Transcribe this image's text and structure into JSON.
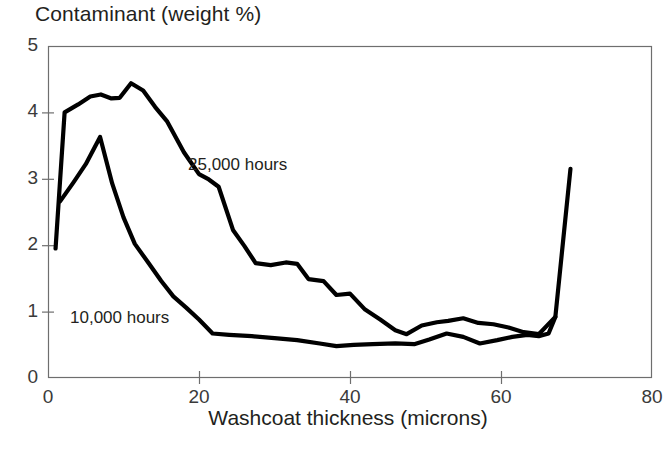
{
  "chart_data": {
    "type": "line",
    "title": "Contaminant (weight %)",
    "xlabel": "Washcoat thickness (microns)",
    "ylabel": "Contaminant (weight %)",
    "xlim": [
      0,
      80
    ],
    "ylim": [
      0,
      5
    ],
    "xticks": [
      "0",
      "20",
      "40",
      "60",
      "80"
    ],
    "yticks": [
      "0",
      "1",
      "2",
      "3",
      "4",
      "5"
    ],
    "grid": false,
    "legend_position": "inline-annotations",
    "line_color": "#000000",
    "axis_color": "#6e6e6e",
    "series": [
      {
        "name": "25,000 hours",
        "label_x": 188,
        "label_y": 155,
        "points": [
          [
            1.0,
            1.95
          ],
          [
            2.2,
            4.0
          ],
          [
            4.0,
            4.12
          ],
          [
            5.6,
            4.24
          ],
          [
            7.0,
            4.27
          ],
          [
            8.4,
            4.21
          ],
          [
            9.5,
            4.22
          ],
          [
            11.0,
            4.44
          ],
          [
            12.6,
            4.33
          ],
          [
            14.2,
            4.08
          ],
          [
            15.8,
            3.86
          ],
          [
            18.0,
            3.4
          ],
          [
            20.0,
            3.07
          ],
          [
            21.3,
            2.99
          ],
          [
            22.6,
            2.88
          ],
          [
            24.5,
            2.23
          ],
          [
            26.0,
            1.99
          ],
          [
            27.5,
            1.73
          ],
          [
            29.5,
            1.7
          ],
          [
            31.5,
            1.74
          ],
          [
            33.0,
            1.72
          ],
          [
            34.5,
            1.49
          ],
          [
            36.5,
            1.46
          ],
          [
            38.2,
            1.25
          ],
          [
            40.0,
            1.27
          ],
          [
            42.0,
            1.03
          ],
          [
            44.0,
            0.88
          ],
          [
            46.0,
            0.72
          ],
          [
            47.5,
            0.66
          ],
          [
            49.5,
            0.79
          ],
          [
            51.5,
            0.84
          ],
          [
            53.0,
            0.86
          ],
          [
            55.0,
            0.9
          ],
          [
            57.0,
            0.83
          ],
          [
            59.0,
            0.81
          ],
          [
            61.0,
            0.76
          ],
          [
            63.0,
            0.69
          ],
          [
            65.0,
            0.66
          ],
          [
            67.2,
            0.92
          ],
          [
            69.2,
            3.15
          ]
        ]
      },
      {
        "name": "10,000 hours",
        "label_x": 70,
        "label_y": 308,
        "points": [
          [
            1.6,
            2.66
          ],
          [
            3.4,
            2.95
          ],
          [
            5.0,
            3.22
          ],
          [
            6.9,
            3.63
          ],
          [
            8.5,
            2.93
          ],
          [
            10.0,
            2.42
          ],
          [
            11.5,
            2.02
          ],
          [
            13.2,
            1.75
          ],
          [
            15.0,
            1.46
          ],
          [
            16.6,
            1.23
          ],
          [
            18.3,
            1.06
          ],
          [
            20.0,
            0.88
          ],
          [
            21.8,
            0.67
          ],
          [
            24.0,
            0.65
          ],
          [
            27.0,
            0.63
          ],
          [
            30.0,
            0.6
          ],
          [
            33.0,
            0.57
          ],
          [
            36.0,
            0.52
          ],
          [
            38.2,
            0.48
          ],
          [
            40.5,
            0.5
          ],
          [
            43.0,
            0.51
          ],
          [
            46.0,
            0.52
          ],
          [
            48.5,
            0.51
          ],
          [
            50.5,
            0.58
          ],
          [
            52.8,
            0.67
          ],
          [
            55.0,
            0.62
          ],
          [
            57.2,
            0.52
          ],
          [
            59.5,
            0.57
          ],
          [
            61.5,
            0.62
          ],
          [
            63.5,
            0.65
          ],
          [
            65.0,
            0.63
          ],
          [
            66.3,
            0.67
          ],
          [
            67.2,
            0.92
          ]
        ]
      }
    ]
  },
  "axes": {
    "y_tick_positions": {
      "0": 378,
      "1": 311.6,
      "2": 245.2,
      "3": 178.8,
      "4": 112.4,
      "5": 46
    },
    "x_tick_positions": {
      "0": 48,
      "20": 199,
      "40": 350,
      "60": 501,
      "80": 652
    }
  }
}
